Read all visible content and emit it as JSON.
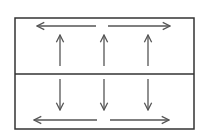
{
  "diagram": {
    "colors": {
      "stroke": "#333333",
      "arrow": "#555555",
      "background": "#ffffff"
    },
    "box": {
      "x": 15,
      "y": 18,
      "width": 179,
      "height": 111
    },
    "divider_y": 74,
    "horizontal_arrows": [
      {
        "id": "top-left",
        "x1": 96,
        "y1": 26,
        "x2": 37,
        "y2": 26
      },
      {
        "id": "top-right",
        "x1": 108,
        "y1": 26,
        "x2": 170,
        "y2": 26
      },
      {
        "id": "bottom-left",
        "x1": 97,
        "y1": 120,
        "x2": 34,
        "y2": 120
      },
      {
        "id": "bottom-right",
        "x1": 110,
        "y1": 120,
        "x2": 169,
        "y2": 120
      }
    ],
    "vertical_arrows": [
      {
        "id": "up-1",
        "x1": 60,
        "y1": 66,
        "x2": 60,
        "y2": 35
      },
      {
        "id": "up-2",
        "x1": 104,
        "y1": 66,
        "x2": 104,
        "y2": 35
      },
      {
        "id": "up-3",
        "x1": 148,
        "y1": 66,
        "x2": 148,
        "y2": 35
      },
      {
        "id": "down-1",
        "x1": 60,
        "y1": 79,
        "x2": 60,
        "y2": 110
      },
      {
        "id": "down-2",
        "x1": 104,
        "y1": 79,
        "x2": 104,
        "y2": 110
      },
      {
        "id": "down-3",
        "x1": 148,
        "y1": 79,
        "x2": 148,
        "y2": 110
      }
    ]
  }
}
